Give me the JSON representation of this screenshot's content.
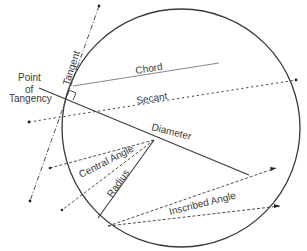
{
  "diagram": {
    "labels": {
      "point_of_tangency_line1": "Point",
      "point_of_tangency_line2": "of",
      "point_of_tangency_line3": "Tangency",
      "tangent": "Tangent",
      "chord": "Chord",
      "secant": "Secant",
      "diameter": "Diameter",
      "central_angle": "Central Angle",
      "radius": "Radius",
      "inscribed_angle": "Inscribed Angle"
    },
    "colors": {
      "line": "#3a3a3a",
      "background": "#ffffff"
    }
  }
}
